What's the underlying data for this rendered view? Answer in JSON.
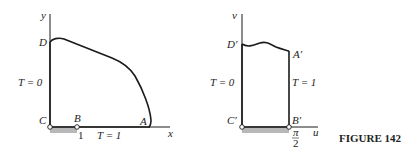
{
  "figure": {
    "caption": "FIGURE 142",
    "left_panel": {
      "axis_x_label": "x",
      "axis_y_label": "y",
      "points": {
        "A": "A",
        "B": "B",
        "C": "C",
        "D": "D"
      },
      "tick_label_B": "1",
      "boundary_labels": {
        "left": "T = 0",
        "bottom": "T = 1"
      }
    },
    "right_panel": {
      "axis_u_label": "u",
      "axis_v_label": "v",
      "points": {
        "A": "A′",
        "B": "B′",
        "C": "C′",
        "D": "D′"
      },
      "tick_label_B_num": "π",
      "tick_label_B_den": "2",
      "boundary_labels": {
        "left": "T = 0",
        "right": "T = 1"
      }
    },
    "colors": {
      "stroke": "#1a1a1a",
      "shade": "#b8b8b8"
    }
  }
}
